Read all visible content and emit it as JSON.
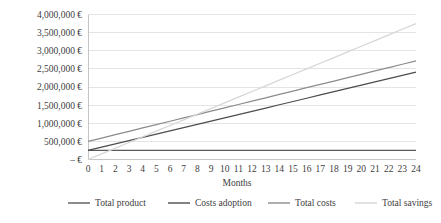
{
  "chart_data": {
    "type": "line",
    "title": "",
    "xlabel": "Months",
    "ylabel": "",
    "x": [
      0,
      1,
      2,
      3,
      4,
      5,
      6,
      7,
      8,
      9,
      10,
      11,
      12,
      13,
      14,
      15,
      16,
      17,
      18,
      19,
      20,
      21,
      22,
      23,
      24
    ],
    "xtick_labels": [
      "0",
      "1",
      "2",
      "3",
      "4",
      "5",
      "6",
      "7",
      "8",
      "9",
      "10",
      "11",
      "12",
      "13",
      "14",
      "15",
      "16",
      "17",
      "18",
      "19",
      "20",
      "21",
      "22",
      "23",
      "24"
    ],
    "ytick_labels": [
      "– €",
      "500,000 €",
      "1,000,000 €",
      "1,500,000 €",
      "2,000,000 €",
      "2,500,000 €",
      "3,000,000 €",
      "3,500,000 €",
      "4,000,000 €"
    ],
    "ytick_values": [
      0,
      500000,
      1000000,
      1500000,
      2000000,
      2500000,
      3000000,
      3500000,
      4000000
    ],
    "ylim": [
      0,
      4000000
    ],
    "xlim": [
      0,
      24
    ],
    "grid": true,
    "legend_position": "bottom",
    "series": [
      {
        "name": "Total product",
        "color": "#595959",
        "values": [
          250000,
          250000,
          250000,
          250000,
          250000,
          250000,
          250000,
          250000,
          250000,
          250000,
          250000,
          250000,
          250000,
          250000,
          250000,
          250000,
          250000,
          250000,
          250000,
          250000,
          250000,
          250000,
          250000,
          250000,
          250000
        ]
      },
      {
        "name": "Costs adoption",
        "color": "#4d4d4d",
        "values": [
          250000,
          340000,
          430000,
          520000,
          610000,
          700000,
          790000,
          880000,
          970000,
          1060000,
          1150000,
          1240000,
          1330000,
          1420000,
          1510000,
          1600000,
          1690000,
          1780000,
          1870000,
          1960000,
          2050000,
          2140000,
          2230000,
          2320000,
          2410000
        ]
      },
      {
        "name": "Total costs",
        "color": "#8c8c8c",
        "values": [
          500000,
          592500,
          685000,
          777500,
          870000,
          962500,
          1055000,
          1147500,
          1240000,
          1332500,
          1425000,
          1517500,
          1610000,
          1702500,
          1795000,
          1887500,
          1980000,
          2072500,
          2165000,
          2257500,
          2350000,
          2442500,
          2535000,
          2627500,
          2720000
        ]
      },
      {
        "name": "Total savings",
        "color": "#d6d6d6",
        "values": [
          0,
          156250,
          312500,
          468750,
          625000,
          781250,
          937500,
          1093750,
          1250000,
          1406250,
          1562500,
          1718750,
          1875000,
          2031250,
          2187500,
          2343750,
          2500000,
          2656250,
          2812500,
          2968750,
          3125000,
          3281250,
          3437500,
          3593750,
          3750000
        ]
      }
    ],
    "colors": {
      "gridline": "#d9d9d9",
      "axisline": "#bfbfbf",
      "text": "#404040",
      "background": "#ffffff"
    }
  },
  "legend": {
    "items": [
      {
        "label": "Total product"
      },
      {
        "label": "Costs adoption"
      },
      {
        "label": "Total costs"
      },
      {
        "label": "Total savings"
      }
    ]
  }
}
